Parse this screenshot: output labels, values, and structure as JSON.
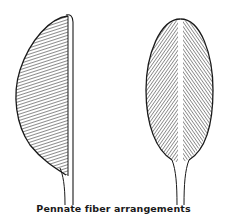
{
  "figure": {
    "caption": "Pennate fiber arrangements",
    "panels": [
      {
        "name": "unipennate-muscle",
        "fiber_direction": "oblique, one side of tendon"
      },
      {
        "name": "bipennate-muscle",
        "fiber_direction": "oblique, both sides of central tendon"
      }
    ],
    "colors": {
      "line": "#1a1a1a",
      "background": "#ffffff"
    }
  }
}
